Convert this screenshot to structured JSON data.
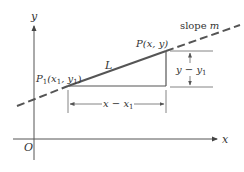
{
  "diagram": {
    "axes": {
      "x_label": "x",
      "y_label": "y",
      "origin_label": "O"
    },
    "points": {
      "p1": {
        "name": "P",
        "sub": "1",
        "coords": "(x",
        "coords_sub": "1",
        "coords_mid": ", y",
        "coords_sub2": "1",
        "coords_end": ")"
      },
      "p": {
        "label": "P(x, y)"
      }
    },
    "line_label": "L",
    "slope_label": {
      "text": "slope ",
      "var": "m"
    },
    "run_label": {
      "main": "x − x",
      "sub": "1"
    },
    "rise_label": {
      "main": "y − y",
      "sub": "1"
    },
    "colors": {
      "stroke": "#444444",
      "line": "#555555",
      "text": "#333333"
    }
  }
}
